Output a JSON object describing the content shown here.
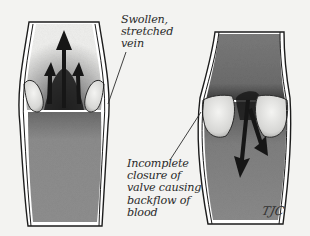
{
  "figure": {
    "panels": [
      {
        "id": "left",
        "description": "Swollen, stretched vein with blood pushing upward through valves",
        "arrow_direction": "up"
      },
      {
        "id": "right",
        "description": "Vein with incomplete valve closure allowing backflow",
        "arrow_direction": "down"
      }
    ],
    "labels": {
      "swollen": {
        "lines": [
          "Swollen,",
          "stretched",
          "vein"
        ]
      },
      "incomplete": {
        "lines": [
          "Incomplete",
          "closure of",
          "valve causing",
          "backflow of",
          "blood"
        ]
      }
    },
    "signature": "TJC",
    "colors": {
      "background": "#f3f3f1",
      "vein_wall": "#ffffff",
      "outline": "#1c1c1c",
      "blood_light": "#8a8a8a",
      "blood_dark": "#6f6f6f",
      "arrow": "#161616",
      "valve_flap": "#e6e6e4"
    }
  }
}
